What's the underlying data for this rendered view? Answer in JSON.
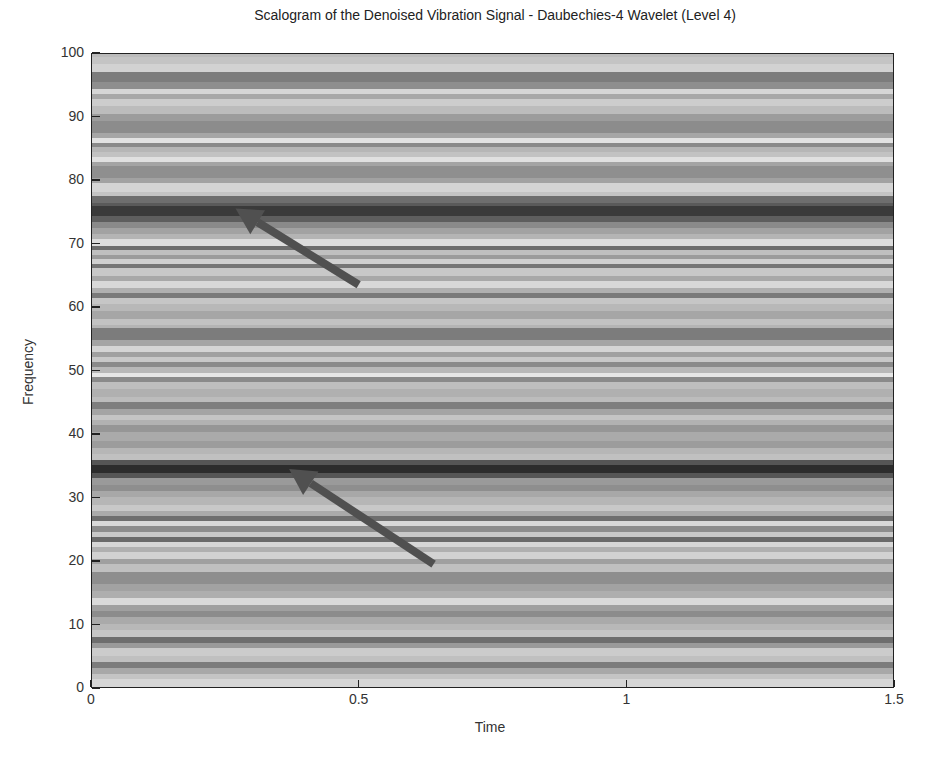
{
  "chart_data": {
    "type": "heatmap",
    "title": "Scalogram of the Denoised Vibration Signal - Daubechies-4 Wavelet (Level 4)",
    "xlabel": "Time",
    "ylabel": "Frequency",
    "xlim": [
      0,
      1.5
    ],
    "ylim": [
      0,
      100
    ],
    "xticks": [
      0,
      0.5,
      1,
      1.5
    ],
    "xtick_labels": [
      "0",
      "0.5",
      "1",
      "1.5"
    ],
    "yticks": [
      0,
      10,
      20,
      30,
      40,
      50,
      60,
      70,
      80,
      90,
      100
    ],
    "ytick_labels": [
      "0",
      "10",
      "20",
      "30",
      "40",
      "50",
      "60",
      "70",
      "80",
      "90",
      "100"
    ],
    "colormap": "gray",
    "grid": false,
    "legend": null,
    "bands": [
      {
        "f0": 99.5,
        "f1": 98.5,
        "color": "#c4c4c4"
      },
      {
        "f0": 98.5,
        "f1": 97.2,
        "color": "#d2d2d2"
      },
      {
        "f0": 97.2,
        "f1": 95.6,
        "color": "#7c7c7c"
      },
      {
        "f0": 95.6,
        "f1": 94.5,
        "color": "#8e8e8e"
      },
      {
        "f0": 94.5,
        "f1": 93.7,
        "color": "#d6d6d6"
      },
      {
        "f0": 93.7,
        "f1": 92.9,
        "color": "#a8a8a8"
      },
      {
        "f0": 92.9,
        "f1": 91.8,
        "color": "#cdcdcd"
      },
      {
        "f0": 91.8,
        "f1": 90.6,
        "color": "#bcbcbc"
      },
      {
        "f0": 90.6,
        "f1": 89.4,
        "color": "#9c9c9c"
      },
      {
        "f0": 89.4,
        "f1": 87.5,
        "color": "#8c8c8c"
      },
      {
        "f0": 87.5,
        "f1": 86.8,
        "color": "#a6a6a6"
      },
      {
        "f0": 86.8,
        "f1": 86.0,
        "color": "#e2e2e2"
      },
      {
        "f0": 86.0,
        "f1": 85.3,
        "color": "#8a8a8a"
      },
      {
        "f0": 85.3,
        "f1": 84.5,
        "color": "#b6b6b6"
      },
      {
        "f0": 84.5,
        "f1": 83.8,
        "color": "#c2c2c2"
      },
      {
        "f0": 83.8,
        "f1": 83.0,
        "color": "#e0e0e0"
      },
      {
        "f0": 83.0,
        "f1": 82.3,
        "color": "#a4a4a4"
      },
      {
        "f0": 82.3,
        "f1": 80.4,
        "color": "#8f8f8f"
      },
      {
        "f0": 80.4,
        "f1": 79.7,
        "color": "#a2a2a2"
      },
      {
        "f0": 79.7,
        "f1": 78.3,
        "color": "#d4d4d4"
      },
      {
        "f0": 78.3,
        "f1": 77.6,
        "color": "#c4c4c4"
      },
      {
        "f0": 77.6,
        "f1": 76.6,
        "color": "#6e6e6e"
      },
      {
        "f0": 76.6,
        "f1": 76.0,
        "color": "#5a5a5a"
      },
      {
        "f0": 76.0,
        "f1": 74.5,
        "color": "#3a3a3a"
      },
      {
        "f0": 74.5,
        "f1": 73.6,
        "color": "#5e5e5e"
      },
      {
        "f0": 73.6,
        "f1": 72.6,
        "color": "#8a8a8a"
      },
      {
        "f0": 72.6,
        "f1": 71.7,
        "color": "#a2a2a2"
      },
      {
        "f0": 71.7,
        "f1": 70.8,
        "color": "#b4b4b4"
      },
      {
        "f0": 70.8,
        "f1": 69.8,
        "color": "#dcdcdc"
      },
      {
        "f0": 69.8,
        "f1": 69.2,
        "color": "#6c6c6c"
      },
      {
        "f0": 69.2,
        "f1": 68.3,
        "color": "#c0c0c0"
      },
      {
        "f0": 68.3,
        "f1": 67.7,
        "color": "#9c9c9c"
      },
      {
        "f0": 67.7,
        "f1": 67.0,
        "color": "#d0d0d0"
      },
      {
        "f0": 67.0,
        "f1": 66.3,
        "color": "#767676"
      },
      {
        "f0": 66.3,
        "f1": 65.1,
        "color": "#c8c8c8"
      },
      {
        "f0": 65.1,
        "f1": 64.2,
        "color": "#a8a8a8"
      },
      {
        "f0": 64.2,
        "f1": 63.2,
        "color": "#d8d8d8"
      },
      {
        "f0": 63.2,
        "f1": 62.4,
        "color": "#b0b0b0"
      },
      {
        "f0": 62.4,
        "f1": 61.6,
        "color": "#7a7a7a"
      },
      {
        "f0": 61.6,
        "f1": 60.7,
        "color": "#c6c6c6"
      },
      {
        "f0": 60.7,
        "f1": 59.6,
        "color": "#b8b8b8"
      },
      {
        "f0": 59.6,
        "f1": 58.3,
        "color": "#a6a6a6"
      },
      {
        "f0": 58.3,
        "f1": 57.4,
        "color": "#c2c2c2"
      },
      {
        "f0": 57.4,
        "f1": 56.8,
        "color": "#b4b4b4"
      },
      {
        "f0": 56.8,
        "f1": 54.9,
        "color": "#7c7c7c"
      },
      {
        "f0": 54.9,
        "f1": 54.0,
        "color": "#a4a4a4"
      },
      {
        "f0": 54.0,
        "f1": 53.1,
        "color": "#d4d4d4"
      },
      {
        "f0": 53.1,
        "f1": 52.3,
        "color": "#a0a0a0"
      },
      {
        "f0": 52.3,
        "f1": 51.5,
        "color": "#c8c8c8"
      },
      {
        "f0": 51.5,
        "f1": 50.7,
        "color": "#8a8a8a"
      },
      {
        "f0": 50.7,
        "f1": 49.8,
        "color": "#b8b8b8"
      },
      {
        "f0": 49.8,
        "f1": 49.1,
        "color": "#e6e6e6"
      },
      {
        "f0": 49.1,
        "f1": 48.3,
        "color": "#8a8a8a"
      },
      {
        "f0": 48.3,
        "f1": 47.2,
        "color": "#bebebe"
      },
      {
        "f0": 47.2,
        "f1": 46.0,
        "color": "#b0b0b0"
      },
      {
        "f0": 46.0,
        "f1": 45.2,
        "color": "#bcbcbc"
      },
      {
        "f0": 45.2,
        "f1": 44.1,
        "color": "#7e7e7e"
      },
      {
        "f0": 44.1,
        "f1": 43.2,
        "color": "#a4a4a4"
      },
      {
        "f0": 43.2,
        "f1": 42.4,
        "color": "#c4c4c4"
      },
      {
        "f0": 42.4,
        "f1": 41.6,
        "color": "#b2b2b2"
      },
      {
        "f0": 41.6,
        "f1": 40.4,
        "color": "#969696"
      },
      {
        "f0": 40.4,
        "f1": 39.0,
        "color": "#aaaaaa"
      },
      {
        "f0": 39.0,
        "f1": 37.9,
        "color": "#9c9c9c"
      },
      {
        "f0": 37.9,
        "f1": 37.0,
        "color": "#b6b6b6"
      },
      {
        "f0": 37.0,
        "f1": 36.0,
        "color": "#c0c0c0"
      },
      {
        "f0": 36.0,
        "f1": 35.3,
        "color": "#555555"
      },
      {
        "f0": 35.3,
        "f1": 34.0,
        "color": "#2c2c2c"
      },
      {
        "f0": 34.0,
        "f1": 33.2,
        "color": "#555555"
      },
      {
        "f0": 33.2,
        "f1": 32.2,
        "color": "#9a9a9a"
      },
      {
        "f0": 32.2,
        "f1": 31.2,
        "color": "#8e8e8e"
      },
      {
        "f0": 31.2,
        "f1": 30.2,
        "color": "#a8a8a8"
      },
      {
        "f0": 30.2,
        "f1": 29.0,
        "color": "#b6b6b6"
      },
      {
        "f0": 29.0,
        "f1": 28.0,
        "color": "#c8c8c8"
      },
      {
        "f0": 28.0,
        "f1": 27.2,
        "color": "#aaaaaa"
      },
      {
        "f0": 27.2,
        "f1": 26.4,
        "color": "#6e6e6e"
      },
      {
        "f0": 26.4,
        "f1": 25.6,
        "color": "#d8d8d8"
      },
      {
        "f0": 25.6,
        "f1": 24.8,
        "color": "#8c8c8c"
      },
      {
        "f0": 24.8,
        "f1": 24.0,
        "color": "#c8c8c8"
      },
      {
        "f0": 24.0,
        "f1": 23.2,
        "color": "#6a6a6a"
      },
      {
        "f0": 23.2,
        "f1": 22.4,
        "color": "#d6d6d6"
      },
      {
        "f0": 22.4,
        "f1": 21.5,
        "color": "#b0b0b0"
      },
      {
        "f0": 21.5,
        "f1": 20.5,
        "color": "#d2d2d2"
      },
      {
        "f0": 20.5,
        "f1": 19.7,
        "color": "#a0a0a0"
      },
      {
        "f0": 19.7,
        "f1": 18.5,
        "color": "#c0c0c0"
      },
      {
        "f0": 18.5,
        "f1": 16.6,
        "color": "#8e8e8e"
      },
      {
        "f0": 16.6,
        "f1": 15.4,
        "color": "#a2a2a2"
      },
      {
        "f0": 15.4,
        "f1": 14.4,
        "color": "#aeaeae"
      },
      {
        "f0": 14.4,
        "f1": 13.3,
        "color": "#dadada"
      },
      {
        "f0": 13.3,
        "f1": 12.3,
        "color": "#a0a0a0"
      },
      {
        "f0": 12.3,
        "f1": 11.3,
        "color": "#8c8c8c"
      },
      {
        "f0": 11.3,
        "f1": 10.3,
        "color": "#aaaaaa"
      },
      {
        "f0": 10.3,
        "f1": 9.3,
        "color": "#b8b8b8"
      },
      {
        "f0": 9.3,
        "f1": 8.2,
        "color": "#c6c6c6"
      },
      {
        "f0": 8.2,
        "f1": 7.3,
        "color": "#6e6e6e"
      },
      {
        "f0": 7.3,
        "f1": 6.4,
        "color": "#9a9a9a"
      },
      {
        "f0": 6.4,
        "f1": 5.2,
        "color": "#cccccc"
      },
      {
        "f0": 5.2,
        "f1": 4.2,
        "color": "#c0c0c0"
      },
      {
        "f0": 4.2,
        "f1": 3.3,
        "color": "#7c7c7c"
      },
      {
        "f0": 3.3,
        "f1": 2.4,
        "color": "#a8a8a8"
      },
      {
        "f0": 2.4,
        "f1": 1.5,
        "color": "#c4c4c4"
      },
      {
        "f0": 1.5,
        "f1": 0.0,
        "color": "#d6d6d6"
      }
    ],
    "annotations": [
      {
        "type": "arrow",
        "from": [
          0.5,
          63.5
        ],
        "to": [
          0.27,
          75.5
        ],
        "color": "#505050",
        "label": ""
      },
      {
        "type": "arrow",
        "from": [
          0.64,
          19.5
        ],
        "to": [
          0.37,
          34.5
        ],
        "color": "#505050",
        "label": ""
      }
    ]
  }
}
